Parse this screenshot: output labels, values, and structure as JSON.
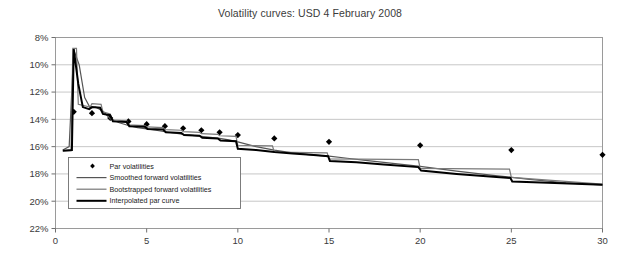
{
  "chart": {
    "title": "Volatility curves: USD 4 February 2008"
  },
  "axes": {
    "y_ticks": [
      "22%",
      "20%",
      "18%",
      "16%",
      "14%",
      "12%",
      "10%",
      "8%"
    ],
    "x_ticks": [
      "0",
      "5",
      "10",
      "15",
      "20",
      "25",
      "30"
    ],
    "ylabel": "",
    "xlabel": ""
  },
  "legend": {
    "items": [
      {
        "label": "Par volatilities",
        "marker": "diamond",
        "color": "#000000"
      },
      {
        "label": "Smoothed forward volatilities",
        "marker": "line",
        "color": "#555555"
      },
      {
        "label": "Bootstrapped forward volatilities",
        "marker": "line",
        "color": "#777777"
      },
      {
        "label": "Interpolated par curve",
        "marker": "line-thick",
        "color": "#000000"
      }
    ]
  },
  "chart_data": {
    "type": "line",
    "title": "Volatility curves: USD 4 February 2008",
    "xlabel": "",
    "ylabel": "",
    "xlim": [
      0,
      30
    ],
    "ylim": [
      8,
      22
    ],
    "x_ticks": [
      0,
      5,
      10,
      15,
      20,
      25,
      30
    ],
    "y_ticks": [
      8,
      10,
      12,
      14,
      16,
      18,
      20,
      22
    ],
    "grid": "horizontal",
    "legend_position": "inside-lower-left",
    "y_unit": "percent",
    "series": [
      {
        "name": "Par volatilities",
        "type": "scatter",
        "marker": "diamond",
        "color": "#000000",
        "points": [
          [
            1,
            16.55
          ],
          [
            2,
            16.45
          ],
          [
            3,
            16.1
          ],
          [
            4,
            15.85
          ],
          [
            5,
            15.65
          ],
          [
            6,
            15.5
          ],
          [
            7,
            15.35
          ],
          [
            8,
            15.2
          ],
          [
            9,
            15.05
          ],
          [
            10,
            14.85
          ],
          [
            12,
            14.6
          ],
          [
            15,
            14.35
          ],
          [
            20,
            14.1
          ],
          [
            25,
            13.75
          ],
          [
            30,
            13.4
          ]
        ]
      },
      {
        "name": "Smoothed forward volatilities",
        "type": "line",
        "color": "#555555",
        "points": [
          [
            0.4,
            13.75
          ],
          [
            0.75,
            14.0
          ],
          [
            1.0,
            21.1
          ],
          [
            1.3,
            20.0
          ],
          [
            1.6,
            17.6
          ],
          [
            1.9,
            16.85
          ],
          [
            2.2,
            16.9
          ],
          [
            2.6,
            16.6
          ],
          [
            3.0,
            16.05
          ],
          [
            3.5,
            15.75
          ],
          [
            4.0,
            15.55
          ],
          [
            4.5,
            15.4
          ],
          [
            5.0,
            15.3
          ],
          [
            5.5,
            15.2
          ],
          [
            6.0,
            15.1
          ],
          [
            6.5,
            15.0
          ],
          [
            7.0,
            14.9
          ],
          [
            7.5,
            14.82
          ],
          [
            8.0,
            14.75
          ],
          [
            8.5,
            14.68
          ],
          [
            9.0,
            14.6
          ],
          [
            9.5,
            14.5
          ],
          [
            10.0,
            14.35
          ],
          [
            11.0,
            14.0
          ],
          [
            12.0,
            13.75
          ],
          [
            13.0,
            13.55
          ],
          [
            14.0,
            13.4
          ],
          [
            15.0,
            13.3
          ],
          [
            16.0,
            13.15
          ],
          [
            17.0,
            13.0
          ],
          [
            18.0,
            12.85
          ],
          [
            19.0,
            12.7
          ],
          [
            20.0,
            12.55
          ],
          [
            22.0,
            12.2
          ],
          [
            24.0,
            11.9
          ],
          [
            26.0,
            11.6
          ],
          [
            28.0,
            11.35
          ],
          [
            30.0,
            11.2
          ]
        ]
      },
      {
        "name": "Bootstrapped forward volatilities",
        "type": "step-line",
        "color": "#7a7a7a",
        "points": [
          [
            0.4,
            13.7
          ],
          [
            0.85,
            13.7
          ],
          [
            0.95,
            21.2
          ],
          [
            1.15,
            21.2
          ],
          [
            1.25,
            17.1
          ],
          [
            1.9,
            16.9
          ],
          [
            2.0,
            17.15
          ],
          [
            2.5,
            17.1
          ],
          [
            2.6,
            16.55
          ],
          [
            3.0,
            16.4
          ],
          [
            3.1,
            15.95
          ],
          [
            3.9,
            15.9
          ],
          [
            4.0,
            15.6
          ],
          [
            4.9,
            15.55
          ],
          [
            5.0,
            15.45
          ],
          [
            5.9,
            15.4
          ],
          [
            6.0,
            15.25
          ],
          [
            6.9,
            15.2
          ],
          [
            7.0,
            15.1
          ],
          [
            7.9,
            15.05
          ],
          [
            8.0,
            14.95
          ],
          [
            8.9,
            14.9
          ],
          [
            9.0,
            14.8
          ],
          [
            9.9,
            14.75
          ],
          [
            10.0,
            14.1
          ],
          [
            11.9,
            14.05
          ],
          [
            12.0,
            13.6
          ],
          [
            14.9,
            13.55
          ],
          [
            15.0,
            13.1
          ],
          [
            19.9,
            13.05
          ],
          [
            20.0,
            12.4
          ],
          [
            24.9,
            12.35
          ],
          [
            25.0,
            11.75
          ],
          [
            30.0,
            11.25
          ]
        ]
      },
      {
        "name": "Interpolated par curve",
        "type": "line",
        "color": "#000000",
        "width": 2,
        "points": [
          [
            0.4,
            13.7
          ],
          [
            0.9,
            13.75
          ],
          [
            1.0,
            21.15
          ],
          [
            1.25,
            18.6
          ],
          [
            1.5,
            16.9
          ],
          [
            1.85,
            16.75
          ],
          [
            2.0,
            16.9
          ],
          [
            2.45,
            16.85
          ],
          [
            2.6,
            16.4
          ],
          [
            3.0,
            16.3
          ],
          [
            3.15,
            15.85
          ],
          [
            3.9,
            15.8
          ],
          [
            4.05,
            15.5
          ],
          [
            4.9,
            15.45
          ],
          [
            5.05,
            15.3
          ],
          [
            5.9,
            15.25
          ],
          [
            6.05,
            15.05
          ],
          [
            6.9,
            15.0
          ],
          [
            7.05,
            14.85
          ],
          [
            7.9,
            14.8
          ],
          [
            8.05,
            14.65
          ],
          [
            8.9,
            14.6
          ],
          [
            9.05,
            14.45
          ],
          [
            9.9,
            14.4
          ],
          [
            10.0,
            13.85
          ],
          [
            11.0,
            13.75
          ],
          [
            12.0,
            13.6
          ],
          [
            13.0,
            13.5
          ],
          [
            14.0,
            13.4
          ],
          [
            14.95,
            13.3
          ],
          [
            15.05,
            12.95
          ],
          [
            16.5,
            12.85
          ],
          [
            18.0,
            12.7
          ],
          [
            19.9,
            12.5
          ],
          [
            20.05,
            12.25
          ],
          [
            22.0,
            12.0
          ],
          [
            24.0,
            11.8
          ],
          [
            24.95,
            11.7
          ],
          [
            25.05,
            11.45
          ],
          [
            27.0,
            11.35
          ],
          [
            30.0,
            11.2
          ]
        ]
      }
    ]
  }
}
